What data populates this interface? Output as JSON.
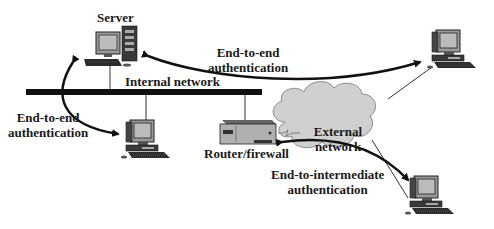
{
  "diagram": {
    "nodes": {
      "server": {
        "label": "Server"
      },
      "internal_network": {
        "label": "Internal network"
      },
      "router_firewall": {
        "label": "Router/firewall"
      },
      "external_network": {
        "label_line1": "External",
        "label_line2": "network"
      },
      "internal_workstation": {
        "label": ""
      },
      "remote_workstation_top": {
        "label": ""
      },
      "remote_workstation_bottom": {
        "label": ""
      }
    },
    "edges": {
      "e2e_remote": {
        "label_line1": "End-to-end",
        "label_line2": "authentication"
      },
      "e2e_internal": {
        "label_line1": "End-to-end",
        "label_line2": "authentication"
      },
      "e2i_router": {
        "label_line1": "End-to-intermediate",
        "label_line2": "authentication"
      }
    },
    "colors": {
      "bus": "#111111",
      "cloud_fill": "#d0d0d0",
      "cloud_stroke": "#8a8a8a",
      "arrow": "#111111",
      "device_body": "#b8b8b8",
      "device_dark": "#2a2a2a",
      "screen": "#bcbcbc"
    }
  }
}
